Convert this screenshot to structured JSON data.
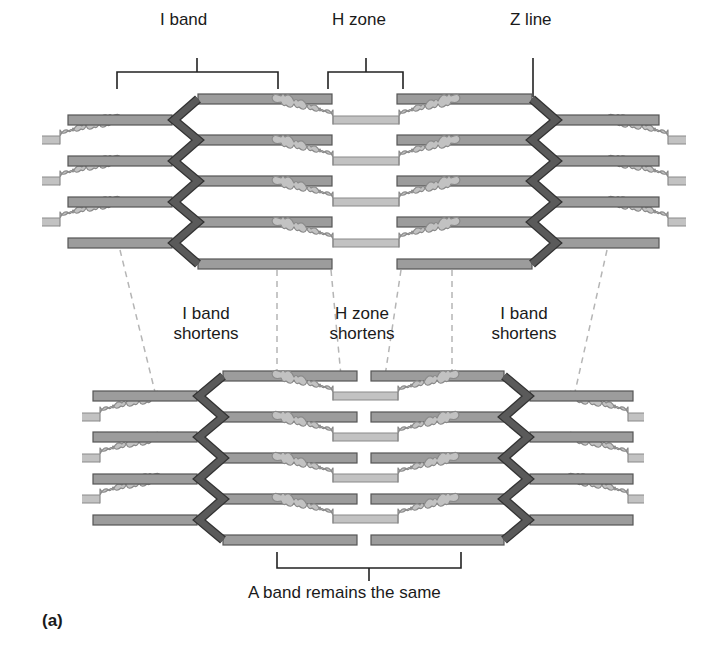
{
  "figure": {
    "panel_label": "(a)",
    "colors": {
      "thin_fill": "#9c9c9c",
      "thin_stroke": "#555555",
      "thick_fill": "#c2c2c2",
      "thick_stroke": "#8a8a8a",
      "zline_fill": "#5a5a5a",
      "zline_stroke": "#333333",
      "bracket": "#222222",
      "dash": "#b5b5b5"
    }
  },
  "relaxed": {
    "labels": {
      "i_band": "I band",
      "h_zone": "H zone",
      "z_line": "Z line"
    }
  },
  "transition": {
    "labels": {
      "left": [
        "I band",
        "shortens"
      ],
      "center": [
        "H zone",
        "shortens"
      ],
      "right": [
        "I band",
        "shortens"
      ]
    }
  },
  "contracted": {
    "labels": {
      "a_band": "A band remains the same"
    }
  }
}
